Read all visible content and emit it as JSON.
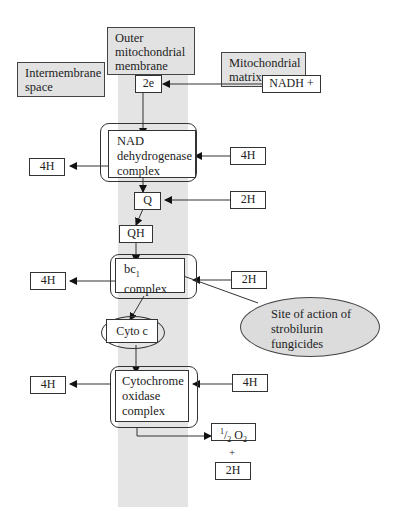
{
  "diagram": {
    "regions": {
      "intermembrane_space": "Intermembrane space",
      "outer_membrane": "Outer mitochondrial membrane",
      "matrix": "Mitochondrial matrix"
    },
    "nodes": {
      "two_e": "2e",
      "nadh": "NADH +",
      "nad_complex": "NAD dehydrogenase complex",
      "q": "Q",
      "qh": "QH",
      "bc1_prefix": "bc",
      "bc1_sub": "1",
      "bc1_suffix": "complex",
      "cyto_c": "Cyto c",
      "cyto_oxidase": "Cytochrome oxidase complex",
      "half": "1",
      "half_den": "2",
      "o2": "O",
      "o2_sub": "2",
      "plus": "+",
      "water_2h": "2H"
    },
    "protons": {
      "left_nad": "4H",
      "right_nad": "4H",
      "right_q": "2H",
      "left_bc1": "4H",
      "right_bc1": "2H",
      "left_cox": "4H",
      "right_cox": "4H"
    },
    "callout": "Site of action of strobilurin fungicides"
  }
}
